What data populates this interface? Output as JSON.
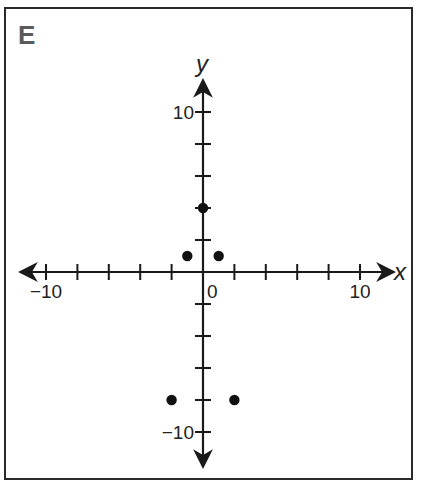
{
  "panel": {
    "label": "E"
  },
  "chart_data": {
    "type": "scatter",
    "title": "E",
    "xlabel": "x",
    "ylabel": "y",
    "xlim": [
      -11,
      12
    ],
    "ylim": [
      -12,
      12
    ],
    "x_ticks": [
      -10,
      -8,
      -6,
      -4,
      -2,
      0,
      2,
      4,
      6,
      8,
      10
    ],
    "y_ticks": [
      -10,
      -8,
      -6,
      -4,
      -2,
      0,
      2,
      4,
      6,
      8,
      10
    ],
    "x_tick_labels": {
      "-10": "−10",
      "0": "0",
      "10": "10"
    },
    "y_tick_labels": {
      "10": "10",
      "-10": "−10"
    },
    "grid": false,
    "points": [
      {
        "x": 0,
        "y": 4
      },
      {
        "x": -1,
        "y": 1
      },
      {
        "x": 1,
        "y": 1
      },
      {
        "x": -2,
        "y": -8
      },
      {
        "x": 2,
        "y": -8
      }
    ]
  },
  "colors": {
    "axis": "#1a1a1a",
    "point": "#111111",
    "label": "#5a5a5a"
  }
}
